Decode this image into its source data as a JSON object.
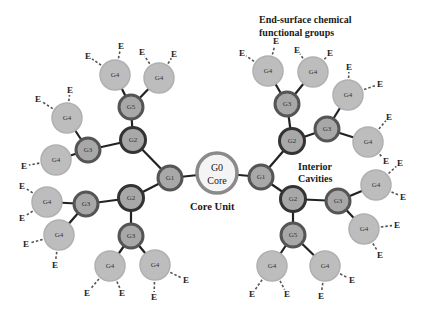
{
  "colors": {
    "bond": "#222222",
    "g4_fill": "#bdbdbd",
    "g4_stroke": "#b0b0b0",
    "inner_fill": "#a8a8a8",
    "inner_stroke": "#555555",
    "g2_stroke": "#333333",
    "core_fill": "#f4f4f4",
    "core_stroke": "#8a8a8a"
  },
  "annotations": {
    "end_groups_line1": "End-surface chemical",
    "end_groups_line2": "functional groups",
    "cavities_line1": "Interior",
    "cavities_line2": "Cavities",
    "core_unit": "Core Unit"
  },
  "core": {
    "label_line1": "G0",
    "label_line2": "Core"
  },
  "end_group_label": "E",
  "nodes": [
    {
      "id": "g1L",
      "label": "G1",
      "gen": "inner"
    },
    {
      "id": "g2LU",
      "label": "G2",
      "gen": "g2"
    },
    {
      "id": "g2LD",
      "label": "G2",
      "gen": "g2"
    },
    {
      "id": "g5LU",
      "label": "G5",
      "gen": "inner"
    },
    {
      "id": "g3LU",
      "label": "G3",
      "gen": "inner"
    },
    {
      "id": "g3LD",
      "label": "G3",
      "gen": "inner"
    },
    {
      "id": "g3LB",
      "label": "G3",
      "gen": "inner"
    },
    {
      "id": "g4a",
      "label": "G4",
      "gen": "g4"
    },
    {
      "id": "g4b",
      "label": "G4",
      "gen": "g4"
    },
    {
      "id": "g4c",
      "label": "G4",
      "gen": "g4"
    },
    {
      "id": "g4d",
      "label": "G4",
      "gen": "g4"
    },
    {
      "id": "g4e",
      "label": "G4",
      "gen": "g4"
    },
    {
      "id": "g4f",
      "label": "G4",
      "gen": "g4"
    },
    {
      "id": "g4g",
      "label": "G4",
      "gen": "g4"
    },
    {
      "id": "g4h",
      "label": "G4",
      "gen": "g4"
    },
    {
      "id": "g1R",
      "label": "G1",
      "gen": "inner"
    },
    {
      "id": "g2RU",
      "label": "G2",
      "gen": "g2"
    },
    {
      "id": "g2RD",
      "label": "G2",
      "gen": "g2"
    },
    {
      "id": "g3RU",
      "label": "G3",
      "gen": "inner"
    },
    {
      "id": "g3RR",
      "label": "G3",
      "gen": "inner"
    },
    {
      "id": "g3RD",
      "label": "G3",
      "gen": "inner"
    },
    {
      "id": "g5RB",
      "label": "G5",
      "gen": "inner"
    },
    {
      "id": "g4i",
      "label": "G4",
      "gen": "g4"
    },
    {
      "id": "g4j",
      "label": "G4",
      "gen": "g4"
    },
    {
      "id": "g4k",
      "label": "G4",
      "gen": "g4"
    },
    {
      "id": "g4l",
      "label": "G4",
      "gen": "g4"
    },
    {
      "id": "g4m",
      "label": "G4",
      "gen": "g4"
    },
    {
      "id": "g4n",
      "label": "G4",
      "gen": "g4"
    },
    {
      "id": "g4o",
      "label": "G4",
      "gen": "g4"
    },
    {
      "id": "g4p",
      "label": "G4",
      "gen": "g4"
    }
  ],
  "edges": [
    [
      "g0",
      "g1L"
    ],
    [
      "g0",
      "g1R"
    ],
    [
      "g1L",
      "g2LU"
    ],
    [
      "g1L",
      "g2LD"
    ],
    [
      "g2LU",
      "g5LU"
    ],
    [
      "g2LU",
      "g3LU"
    ],
    [
      "g2LD",
      "g3LD"
    ],
    [
      "g2LD",
      "g3LB"
    ],
    [
      "g5LU",
      "g4a"
    ],
    [
      "g5LU",
      "g4b"
    ],
    [
      "g3LU",
      "g4c"
    ],
    [
      "g3LU",
      "g4d"
    ],
    [
      "g3LD",
      "g4e"
    ],
    [
      "g3LD",
      "g4f"
    ],
    [
      "g3LB",
      "g4g"
    ],
    [
      "g3LB",
      "g4h"
    ],
    [
      "g1R",
      "g2RU"
    ],
    [
      "g1R",
      "g2RD"
    ],
    [
      "g2RU",
      "g3RU"
    ],
    [
      "g2RU",
      "g3RR"
    ],
    [
      "g2RD",
      "g3RD"
    ],
    [
      "g2RD",
      "g5RB"
    ],
    [
      "g3RU",
      "g4i"
    ],
    [
      "g3RU",
      "g4j"
    ],
    [
      "g3RR",
      "g4k"
    ],
    [
      "g3RR",
      "g4l"
    ],
    [
      "g3RD",
      "g4m"
    ],
    [
      "g3RD",
      "g4n"
    ],
    [
      "g5RB",
      "g4o"
    ],
    [
      "g5RB",
      "g4p"
    ]
  ]
}
